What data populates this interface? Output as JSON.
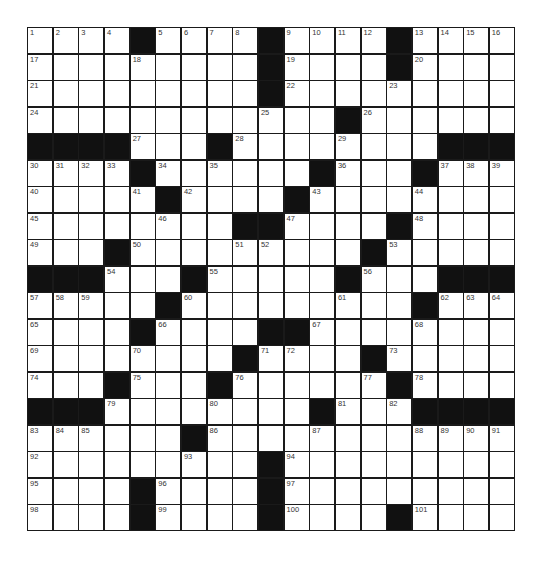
{
  "puzzle": {
    "rows": 19,
    "cols": 19,
    "block_color": "#111111",
    "cell_color": "#ffffff",
    "grid": [
      [
        "1",
        "2",
        "3",
        "4",
        "#",
        "5",
        "6",
        "7",
        "8",
        "#",
        "9",
        "10",
        "11",
        "12",
        "#",
        "13",
        "14",
        "15",
        "16"
      ],
      [
        "17",
        "",
        "",
        "",
        "18",
        "",
        "",
        "",
        "",
        "#",
        "19",
        "",
        "",
        "",
        "#",
        "20",
        "",
        "",
        ""
      ],
      [
        "21",
        "",
        "",
        "",
        "",
        "",
        "",
        "",
        "",
        "#",
        "22",
        "",
        "",
        "",
        "23",
        "",
        "",
        "",
        ""
      ],
      [
        "24",
        "",
        "",
        "",
        "",
        "",
        "",
        "",
        "",
        "25",
        "",
        "",
        "#",
        "26",
        "",
        "",
        "",
        "",
        ""
      ],
      [
        "#",
        "#",
        "#",
        "#",
        "27",
        "",
        "",
        "#",
        "28",
        "",
        "",
        "",
        "29",
        "",
        "",
        "",
        "#",
        "#",
        "#"
      ],
      [
        "30",
        "31",
        "32",
        "33",
        "#",
        "34",
        "",
        "35",
        "",
        "",
        "",
        "#",
        "36",
        "",
        "",
        "#",
        "37",
        "38",
        "39"
      ],
      [
        "40",
        "",
        "",
        "",
        "41",
        "#",
        "42",
        "",
        "",
        "",
        "#",
        "43",
        "",
        "",
        "",
        "44",
        "",
        "",
        ""
      ],
      [
        "45",
        "",
        "",
        "",
        "",
        "46",
        "",
        "",
        "#",
        "#",
        "47",
        "",
        "",
        "",
        "#",
        "48",
        "",
        "",
        ""
      ],
      [
        "49",
        "",
        "",
        "#",
        "50",
        "",
        "",
        "",
        "51",
        "52",
        "",
        "",
        "",
        "#",
        "53",
        "",
        "",
        "",
        ""
      ],
      [
        "#",
        "#",
        "#",
        "54",
        "",
        "",
        "#",
        "55",
        "",
        "",
        "",
        "",
        "#",
        "56",
        "",
        "",
        "#",
        "#",
        "#"
      ],
      [
        "57",
        "58",
        "59",
        "",
        "",
        "#",
        "60",
        "",
        "",
        "",
        "",
        "",
        "61",
        "",
        "",
        "#",
        "62",
        "63",
        "64"
      ],
      [
        "65",
        "",
        "",
        "",
        "#",
        "66",
        "",
        "",
        "",
        "#",
        "#",
        "67",
        "",
        "",
        "",
        "68",
        "",
        "",
        ""
      ],
      [
        "69",
        "",
        "",
        "",
        "70",
        "",
        "",
        "",
        "#",
        "71",
        "72",
        "",
        "",
        "#",
        "73",
        "",
        "",
        "",
        ""
      ],
      [
        "74",
        "",
        "",
        "#",
        "75",
        "",
        "",
        "#",
        "76",
        "",
        "",
        "",
        "",
        "77",
        "#",
        "78",
        "",
        "",
        ""
      ],
      [
        "#",
        "#",
        "#",
        "79",
        "",
        "",
        "",
        "80",
        "",
        "",
        "",
        "#",
        "81",
        "",
        "82",
        "#",
        "#",
        "#",
        "#"
      ],
      [
        "83",
        "84",
        "85",
        "",
        "",
        "",
        "#",
        "86",
        "",
        "",
        "",
        "87",
        "",
        "",
        "",
        "88",
        "89",
        "90",
        "91"
      ],
      [
        "92",
        "",
        "",
        "",
        "",
        "",
        "93",
        "",
        "",
        "#",
        "94",
        "",
        "",
        "",
        "",
        "",
        "",
        "",
        ""
      ],
      [
        "95",
        "",
        "",
        "",
        "#",
        "96",
        "",
        "",
        "",
        "#",
        "97",
        "",
        "",
        "",
        "",
        "",
        "",
        "",
        ""
      ],
      [
        "98",
        "",
        "",
        "",
        "#",
        "99",
        "",
        "",
        "",
        "#",
        "100",
        "",
        "",
        "",
        "#",
        "101",
        "",
        "",
        ""
      ]
    ]
  }
}
